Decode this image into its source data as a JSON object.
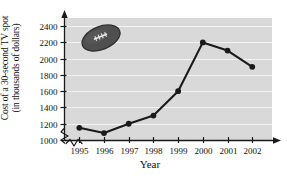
{
  "chart_data": {
    "type": "line",
    "title": "",
    "xlabel": "Year",
    "ylabel_line1": "Cost of a 30-second TV spot",
    "ylabel_line2": "(in thousands of dollars)",
    "categories": [
      "1995",
      "1996",
      "1997",
      "1998",
      "1999",
      "2000",
      "2001",
      "2002"
    ],
    "x": [
      1995,
      1996,
      1997,
      1998,
      1999,
      2000,
      2001,
      2002
    ],
    "values": [
      1150,
      1085,
      1200,
      1300,
      1600,
      2200,
      2100,
      1900
    ],
    "series": [
      {
        "name": "Cost of a 30-second TV spot",
        "values": [
          1150,
          1085,
          1200,
          1300,
          1600,
          2200,
          2100,
          1900
        ]
      }
    ],
    "yticks": [
      1000,
      1200,
      1400,
      1600,
      1800,
      2000,
      2200,
      2400
    ],
    "ytick_labels": [
      "1000",
      "1200",
      "1400",
      "1600",
      "1800",
      "2000",
      "2200",
      "2400"
    ],
    "ylim": [
      1000,
      2500
    ],
    "xlim": [
      1994.4,
      2002.8
    ],
    "grid": "horizontal",
    "legend": "none",
    "axis_break": "y-axis zigzag break below 1000",
    "annotations": [
      "football-image"
    ],
    "colors": {
      "plot_background": "#d9d9d9",
      "gridline": "#f2f2f2",
      "line": "#1a1a1a",
      "marker": "#1a1a1a",
      "axis": "#1a1a1a",
      "text": "#111111",
      "football": "#4a4a4a"
    }
  }
}
